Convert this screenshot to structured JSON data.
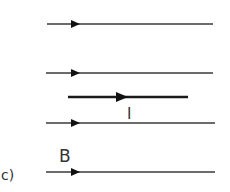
{
  "diagram": {
    "part_label": "c)",
    "field_label": "B",
    "current_label": "I",
    "colors": {
      "field_line": "#3a3a3a",
      "current_wire": "#1a1a1a",
      "text": "#333333"
    },
    "field_lines": [
      {
        "y": 24,
        "x1": 47,
        "x2": 213,
        "arrow_x": 80
      },
      {
        "y": 73,
        "x1": 46,
        "x2": 213,
        "arrow_x": 80
      },
      {
        "y": 123,
        "x1": 46,
        "x2": 215,
        "arrow_x": 80
      },
      {
        "y": 172,
        "x1": 46,
        "x2": 215,
        "arrow_x": 80
      }
    ],
    "current_wire": {
      "y": 97,
      "x1": 68,
      "x2": 188,
      "arrow_x": 127
    }
  }
}
